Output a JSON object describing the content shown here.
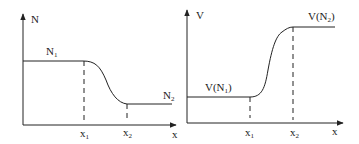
{
  "panels": [
    {
      "id": "left",
      "y_axis_label": "N",
      "x_axis_label": "x",
      "level_left_label": {
        "base": "N",
        "sub": "1"
      },
      "level_right_label": {
        "base": "N",
        "sub": "2"
      },
      "x_ticks": [
        {
          "base": "x",
          "sub": "1"
        },
        {
          "base": "x",
          "sub": "2"
        }
      ]
    },
    {
      "id": "right",
      "y_axis_label": "V",
      "x_axis_label": "x",
      "level_left_label": {
        "pre": "V(N",
        "sub": "1",
        "post": ")"
      },
      "level_right_label": {
        "pre": "V(N",
        "sub": "2",
        "post": ")"
      },
      "x_ticks": [
        {
          "base": "x",
          "sub": "1"
        },
        {
          "base": "x",
          "sub": "2"
        }
      ]
    }
  ],
  "colors": {
    "line": "#222222",
    "background": "#ffffff"
  }
}
